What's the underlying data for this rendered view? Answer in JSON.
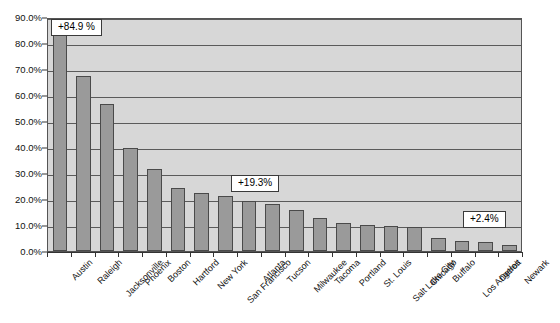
{
  "chart_data": {
    "type": "bar",
    "title": "",
    "subtitle": "",
    "xlabel": "",
    "ylabel": "",
    "ylim": [
      0,
      90
    ],
    "grid": true,
    "legend": false,
    "y_tick_labels": [
      "90.0%",
      "80.0%",
      "70.0%",
      "60.0%",
      "50.0%",
      "40.0%",
      "30.0%",
      "20.0%",
      "10.0%",
      "0.0%"
    ],
    "y_tick_values": [
      90,
      80,
      70,
      60,
      50,
      40,
      30,
      20,
      10,
      0
    ],
    "categories": [
      "Austin",
      "Raleigh",
      "Jacksonville",
      "Phoenix",
      "Boston",
      "Hartford",
      "New York",
      "San Francisco",
      "Atlanta",
      "Tucson",
      "Milwaukee",
      "Tacoma",
      "Portland",
      "St. Louis",
      "Salt Lake City",
      "Chicago",
      "Buffalo",
      "Los Angeles",
      "Detroit",
      "Newark"
    ],
    "values": [
      84.9,
      67.3,
      56.5,
      39.6,
      31.6,
      24.1,
      22.5,
      21.2,
      19.3,
      18.0,
      15.6,
      12.8,
      10.8,
      9.9,
      9.7,
      9.1,
      5.0,
      4.0,
      3.4,
      2.4
    ],
    "annotations": [
      {
        "label": "+84.9 %",
        "category": "Austin",
        "value": 84.9
      },
      {
        "label": "+19.3%",
        "category": "Atlanta",
        "value": 19.3
      },
      {
        "label": "+2.4%",
        "category": "Newark",
        "value": 2.4
      }
    ],
    "colors": {
      "bar_fill": "#9a9a9a",
      "bar_border": "#4a4a4a",
      "plot_background": "#d7d7d7",
      "gridline": "#5a5a5a",
      "axis": "#333333",
      "callout_background": "#ffffff",
      "callout_border": "#3a3a3a",
      "text": "#111111"
    }
  }
}
